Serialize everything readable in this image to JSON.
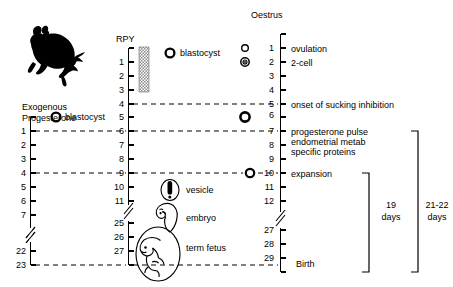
{
  "figure": {
    "title": "",
    "animal_icon": "wallaby-silhouette"
  },
  "axes": {
    "exogenous_progesterone": {
      "header_line1": "Exogenous",
      "header_line2": "Progesterone",
      "ticks": [
        "1",
        "2",
        "3",
        "4",
        "5",
        "6",
        "7",
        "22",
        "23"
      ],
      "has_break": true,
      "break_after_index": 6,
      "top_marker_label": "blastocyst",
      "top_marker_icon": "open-circle"
    },
    "rpy": {
      "header": "RPY",
      "ticks": [
        "1",
        "2",
        "3",
        "4",
        "5",
        "6",
        "7",
        "8",
        "9",
        "10",
        "11",
        "25",
        "26",
        "27"
      ],
      "has_break": true,
      "break_after_index": 10,
      "top_marker_label": "blastocyst",
      "top_marker_icon": "open-circle",
      "shaded_bar": "stipple-gray"
    },
    "oestrus": {
      "header": "Oestrus",
      "ticks": [
        "1",
        "2",
        "3",
        "4",
        "5",
        "6",
        "7",
        "8",
        "9",
        "10",
        "11",
        "12",
        "27",
        "28",
        "29"
      ],
      "has_break": true,
      "break_after_index": 11,
      "markers": [
        {
          "tick": "1",
          "icon": "small-open-circle"
        },
        {
          "tick": "2",
          "icon": "target-circle"
        },
        {
          "tick": "6",
          "icon": "bold-open-circle"
        }
      ]
    }
  },
  "events": {
    "ovulation": "ovulation",
    "two_cell": "2-cell",
    "sucking_inhibition": "onset of sucking inhibition",
    "progesterone_block_line1": "progesterone pulse",
    "progesterone_block_line2": "endometrial metab",
    "progesterone_block_line3": "specific proteins",
    "expansion": "expansion",
    "birth": "Birth"
  },
  "stage_labels": {
    "vesicle": "vesicle",
    "embryo": "embryo",
    "term_fetus": "term fetus"
  },
  "duration_brackets": [
    {
      "name": "gestation-19",
      "line1": "19",
      "line2": "days"
    },
    {
      "name": "gestation-21-22",
      "line1": "21-22",
      "line2": "days"
    }
  ],
  "colors": {
    "line": "#000000",
    "shade": "#9a9a9a",
    "background": "#ffffff"
  }
}
